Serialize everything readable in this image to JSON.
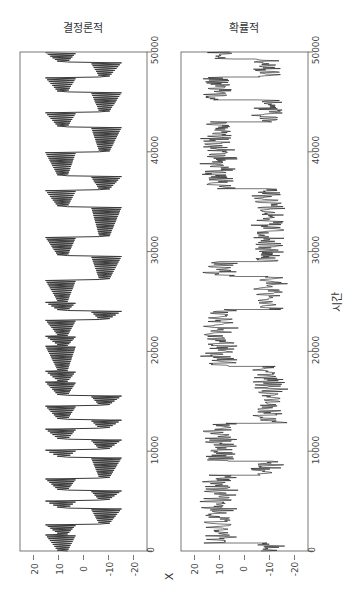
{
  "chart_data": [
    {
      "type": "line",
      "title": "결정론적",
      "xlabel": "X",
      "ylabel": "시간",
      "orientation": "rotated: time on vertical axis (0 bottom, 50000 top), X on horizontal axis reversed (20 left, -20 right)",
      "x_ticks": [
        20,
        10,
        0,
        -10,
        -20
      ],
      "y_ticks": [
        0,
        10000,
        20000,
        30000,
        40000,
        50000
      ],
      "xlim": [
        -25,
        25
      ],
      "ylim": [
        0,
        50000
      ],
      "grid": false,
      "description": "Lorenz-like deterministic trajectory switching between two lobes (~+8 and ~-8) with growing oscillations before each switch",
      "lobe_segments": [
        {
          "t_start": 0,
          "t_end": 1700,
          "lobe": 8
        },
        {
          "t_start": 1700,
          "t_end": 2700,
          "lobe": 8
        },
        {
          "t_start": 2700,
          "t_end": 4300,
          "lobe": -8
        },
        {
          "t_start": 4300,
          "t_end": 5100,
          "lobe": 8
        },
        {
          "t_start": 5100,
          "t_end": 6100,
          "lobe": -8
        },
        {
          "t_start": 6100,
          "t_end": 7300,
          "lobe": 8
        },
        {
          "t_start": 7300,
          "t_end": 9400,
          "lobe": -8
        },
        {
          "t_start": 9400,
          "t_end": 10200,
          "lobe": 8
        },
        {
          "t_start": 10200,
          "t_end": 11200,
          "lobe": -8
        },
        {
          "t_start": 11200,
          "t_end": 12300,
          "lobe": 8
        },
        {
          "t_start": 12300,
          "t_end": 13200,
          "lobe": -8
        },
        {
          "t_start": 13200,
          "t_end": 14600,
          "lobe": 8
        },
        {
          "t_start": 14600,
          "t_end": 15600,
          "lobe": -8
        },
        {
          "t_start": 15600,
          "t_end": 17000,
          "lobe": 8
        },
        {
          "t_start": 17000,
          "t_end": 18100,
          "lobe": 8
        },
        {
          "t_start": 18100,
          "t_end": 20600,
          "lobe": 8
        },
        {
          "t_start": 20600,
          "t_end": 21600,
          "lobe": 8
        },
        {
          "t_start": 21600,
          "t_end": 23200,
          "lobe": 8
        },
        {
          "t_start": 23200,
          "t_end": 24100,
          "lobe": -8
        },
        {
          "t_start": 24100,
          "t_end": 25000,
          "lobe": 8
        },
        {
          "t_start": 25000,
          "t_end": 27200,
          "lobe": 8
        },
        {
          "t_start": 27200,
          "t_end": 29600,
          "lobe": -8
        },
        {
          "t_start": 29600,
          "t_end": 31500,
          "lobe": 8
        },
        {
          "t_start": 31500,
          "t_end": 34500,
          "lobe": -8
        },
        {
          "t_start": 34500,
          "t_end": 36200,
          "lobe": 8
        },
        {
          "t_start": 36200,
          "t_end": 37600,
          "lobe": -8
        },
        {
          "t_start": 37600,
          "t_end": 40000,
          "lobe": 8
        },
        {
          "t_start": 40000,
          "t_end": 42500,
          "lobe": -8
        },
        {
          "t_start": 42500,
          "t_end": 44000,
          "lobe": 8
        },
        {
          "t_start": 44000,
          "t_end": 46000,
          "lobe": -8
        },
        {
          "t_start": 46000,
          "t_end": 47500,
          "lobe": 8
        },
        {
          "t_start": 47500,
          "t_end": 49000,
          "lobe": -8
        },
        {
          "t_start": 49000,
          "t_end": 50000,
          "lobe": 8
        }
      ],
      "value_range": [
        -18,
        18
      ]
    },
    {
      "type": "line",
      "title": "확률적",
      "xlabel": "X",
      "ylabel": "시간",
      "orientation": "rotated: time on vertical axis (0 bottom, 50000 top), X on horizontal axis reversed (20 left, -20 right)",
      "x_ticks": [
        20,
        10,
        0,
        -10,
        -20
      ],
      "y_ticks": [
        0,
        10000,
        20000,
        30000,
        40000,
        50000
      ],
      "xlim": [
        -25,
        25
      ],
      "ylim": [
        0,
        50000
      ],
      "grid": false,
      "description": "Noisy stochastic switching between two states at about +10 and -10",
      "regimes": [
        {
          "t_start": 0,
          "t_end": 800,
          "level": -10
        },
        {
          "t_start": 800,
          "t_end": 7600,
          "level": 10
        },
        {
          "t_start": 7600,
          "t_end": 9000,
          "level": -10
        },
        {
          "t_start": 9000,
          "t_end": 12800,
          "level": 10
        },
        {
          "t_start": 12800,
          "t_end": 18500,
          "level": -10
        },
        {
          "t_start": 18500,
          "t_end": 24200,
          "level": 10
        },
        {
          "t_start": 24200,
          "t_end": 27500,
          "level": -10
        },
        {
          "t_start": 27500,
          "t_end": 29000,
          "level": 10
        },
        {
          "t_start": 29000,
          "t_end": 36300,
          "level": -10
        },
        {
          "t_start": 36300,
          "t_end": 43000,
          "level": 10
        },
        {
          "t_start": 43000,
          "t_end": 45200,
          "level": -10
        },
        {
          "t_start": 45200,
          "t_end": 47500,
          "level": 10
        },
        {
          "t_start": 47500,
          "t_end": 49300,
          "level": -10
        },
        {
          "t_start": 49300,
          "t_end": 50000,
          "level": 10
        }
      ],
      "noise_amplitude": 8
    }
  ],
  "figure": {
    "panels": [
      {
        "title": "결정론적",
        "x_tick_labels": [
          "20",
          "10",
          "0",
          "-10",
          "-20"
        ],
        "y_tick_labels": [
          "0",
          "10000",
          "20000",
          "30000",
          "40000",
          "50000"
        ]
      },
      {
        "title": "확률적",
        "x_tick_labels": [
          "20",
          "10",
          "0",
          "-10",
          "-20"
        ],
        "y_tick_labels": [
          "0",
          "10000",
          "20000",
          "30000",
          "40000",
          "50000"
        ]
      }
    ],
    "xlabel": "X",
    "ylabel": "시간",
    "line_color": "#1a1a1a",
    "axis_color": "#555555"
  }
}
